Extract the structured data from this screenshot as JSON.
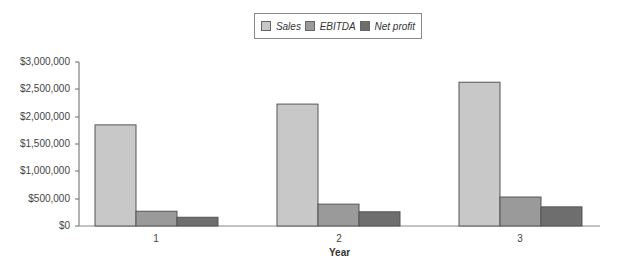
{
  "chart_data": {
    "type": "bar",
    "title": "",
    "xlabel": "Year",
    "ylabel": "",
    "categories": [
      "1",
      "2",
      "3"
    ],
    "series": [
      {
        "name": "Sales",
        "values": [
          1850000,
          2230000,
          2630000
        ],
        "color": "#c8c8c8"
      },
      {
        "name": "EBITDA",
        "values": [
          270000,
          400000,
          530000
        ],
        "color": "#9a9a9a"
      },
      {
        "name": "Net profit",
        "values": [
          160000,
          260000,
          350000
        ],
        "color": "#6e6e6e"
      }
    ],
    "ylim": [
      0,
      3000000
    ],
    "yticks": [
      "$0",
      "$500,000",
      "$1,000,000",
      "$1,500,000",
      "$2,000,000",
      "$2,500,000",
      "$3,000,000"
    ],
    "grid": false,
    "legend_position": "top-center"
  },
  "legend": {
    "items": [
      {
        "label": "Sales",
        "color": "#c8c8c8"
      },
      {
        "label": "EBITDA",
        "color": "#9a9a9a"
      },
      {
        "label": "Net profit",
        "color": "#6e6e6e"
      }
    ]
  },
  "axes": {
    "x_title": "Year",
    "x_labels": [
      "1",
      "2",
      "3"
    ],
    "y_labels": [
      "$3,000,000",
      "$2,500,000",
      "$2,000,000",
      "$1,500,000",
      "$1,000,000",
      "$500,000",
      "$0"
    ]
  }
}
